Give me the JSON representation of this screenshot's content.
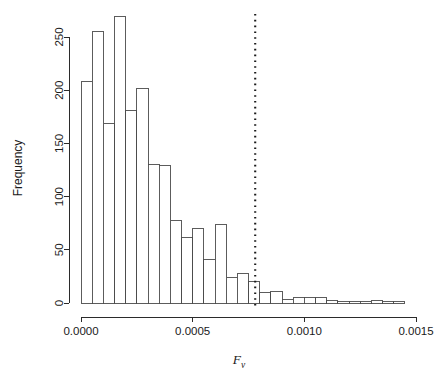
{
  "chart_data": {
    "type": "bar",
    "subtype": "histogram",
    "title": "",
    "xlabel": "F_v",
    "xlabel_base": "F",
    "xlabel_subscript": "v",
    "ylabel": "Frequency",
    "xlim": [
      0.0,
      0.0015
    ],
    "ylim": [
      0,
      270
    ],
    "grid": false,
    "legend": "none",
    "bin_width": 5e-05,
    "x_ticks": [
      0.0,
      0.0005,
      0.001,
      0.0015
    ],
    "x_tick_labels": [
      "0.0000",
      "0.0005",
      "0.0010",
      "0.0015"
    ],
    "y_ticks": [
      0,
      50,
      100,
      150,
      200,
      250
    ],
    "y_tick_labels": [
      "0",
      "50",
      "100",
      "150",
      "200",
      "250"
    ],
    "bin_starts": [
      0.0,
      5e-05,
      0.0001,
      0.00015,
      0.0002,
      0.00025,
      0.0003,
      0.00035,
      0.0004,
      0.00045,
      0.0005,
      0.00055,
      0.0006,
      0.00065,
      0.0007,
      0.00075,
      0.0008,
      0.00085,
      0.0009,
      0.00095,
      0.001,
      0.00105,
      0.0011,
      0.00115,
      0.0012,
      0.00125,
      0.0013,
      0.00135,
      0.0014
    ],
    "values": [
      208,
      255,
      169,
      269,
      181,
      202,
      130,
      129,
      78,
      62,
      70,
      41,
      74,
      24,
      28,
      20,
      10,
      11,
      3,
      5,
      5,
      5,
      2,
      1,
      1,
      1,
      2,
      1,
      1
    ],
    "annotations": [
      {
        "type": "vertical-dotted-line",
        "name": "threshold-line",
        "x": 0.00078,
        "style": "dotted",
        "label": ""
      }
    ]
  },
  "plot_geometry": {
    "x_pixel_at_xmin": 81,
    "x_pixel_at_xmax": 416,
    "y_pixel_at_ymin": 303,
    "y_pixel_at_ymax": 37,
    "y_value_at_ymax": 250
  }
}
